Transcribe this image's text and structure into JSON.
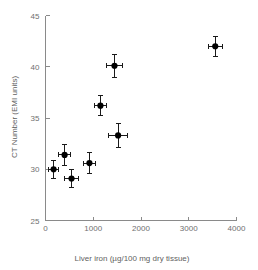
{
  "chart_data": {
    "type": "scatter",
    "title": "",
    "xlabel": "Liver iron (µg/100 mg dry tissue)",
    "ylabel": "CT Number (EMI units)",
    "xlim": [
      0,
      4000
    ],
    "ylim": [
      25,
      45
    ],
    "xticks": [
      0,
      1000,
      2000,
      3000,
      4000
    ],
    "yticks": [
      25,
      30,
      35,
      40,
      45
    ],
    "xticklabels": [
      "0",
      "1000",
      "2000",
      "3000",
      "4000"
    ],
    "yticklabels": [
      "25",
      "30",
      "35",
      "40",
      "45"
    ],
    "grid": false,
    "legend": false,
    "marker": "filled-circle",
    "marker_color": "#000000",
    "errorbars": "both",
    "points": [
      {
        "x": 170,
        "y": 30.0,
        "xerr": 110,
        "yerr": 0.9
      },
      {
        "x": 400,
        "y": 31.4,
        "xerr": 130,
        "yerr": 1.0
      },
      {
        "x": 545,
        "y": 29.1,
        "xerr": 150,
        "yerr": 0.9
      },
      {
        "x": 920,
        "y": 30.6,
        "xerr": 130,
        "yerr": 1.0
      },
      {
        "x": 1150,
        "y": 36.2,
        "xerr": 120,
        "yerr": 1.0
      },
      {
        "x": 1445,
        "y": 40.1,
        "xerr": 160,
        "yerr": 1.1
      },
      {
        "x": 1520,
        "y": 33.3,
        "xerr": 200,
        "yerr": 1.2
      },
      {
        "x": 3555,
        "y": 42.0,
        "xerr": 150,
        "yerr": 1.0
      }
    ]
  },
  "axes": {
    "x_axis_name": "liver-iron-axis",
    "y_axis_name": "ct-number-axis"
  }
}
